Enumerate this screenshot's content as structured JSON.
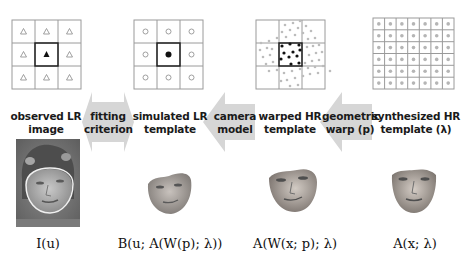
{
  "stages": [
    {
      "id": "observed",
      "label_line1": "observed LR",
      "label_line2": "image",
      "formula": "I(u)"
    },
    {
      "id": "simulated",
      "label_line1": "simulated LR",
      "label_line2": "template",
      "formula": "B(u; A(W(p); λ))"
    },
    {
      "id": "warped",
      "label_line1": "warped HR",
      "label_line2": "template",
      "formula": "A(W(x; p); λ)"
    },
    {
      "id": "synthesized",
      "label_line1": "synthesized HR",
      "label_line2": "template (λ)",
      "formula": "A(x; λ)"
    }
  ],
  "arrows": [
    {
      "id": "fitting",
      "line1": "fitting",
      "line2": "criterion",
      "direction": "both"
    },
    {
      "id": "camera",
      "line1": "camera",
      "line2": "model",
      "direction": "left"
    },
    {
      "id": "geometric",
      "line1": "geometric",
      "line2": "warp (p)",
      "direction": "left"
    }
  ],
  "grids": {
    "observed": {
      "rows": 3,
      "cols": 3,
      "marker": "triangle",
      "center_marker": "filled-triangle"
    },
    "simulated": {
      "rows": 3,
      "cols": 3,
      "marker": "circle",
      "center_marker": "filled-circle"
    },
    "warped": {
      "rows": 3,
      "cols": 3,
      "marker": "scattered-dots",
      "center_marker": "dark-dots"
    },
    "synthesized": {
      "rows": 6,
      "cols": 7,
      "marker": "gray-dot"
    }
  },
  "colors": {
    "arrow_fill": "#d6d6d6",
    "grid_line": "#9a9a9a",
    "grid_center": "#222222",
    "marker_gray": "#aaaaaa"
  }
}
